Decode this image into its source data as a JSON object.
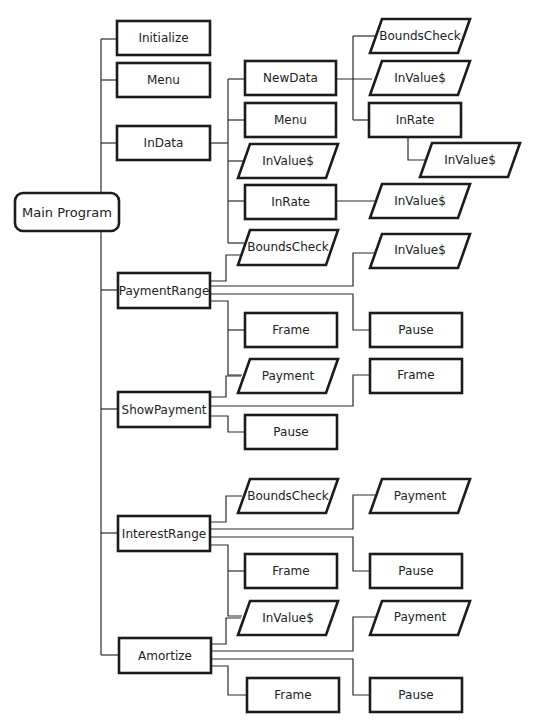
{
  "diagram": {
    "type": "structure-chart",
    "root": {
      "id": "main",
      "label": "Main Program",
      "shape": "rounded"
    },
    "nodes": [
      {
        "id": "initialize",
        "label": "Initialize",
        "shape": "rect",
        "parent": "main"
      },
      {
        "id": "menu",
        "label": "Menu",
        "shape": "rect",
        "parent": "main"
      },
      {
        "id": "indata",
        "label": "InData",
        "shape": "rect",
        "parent": "main"
      },
      {
        "id": "indata_newdata",
        "label": "NewData",
        "shape": "rect",
        "parent": "indata"
      },
      {
        "id": "indata_menu",
        "label": "Menu",
        "shape": "rect",
        "parent": "indata"
      },
      {
        "id": "indata_invalue",
        "label": "InValue$",
        "shape": "io",
        "parent": "indata"
      },
      {
        "id": "indata_inrate",
        "label": "InRate",
        "shape": "rect",
        "parent": "indata"
      },
      {
        "id": "indata_boundscheck",
        "label": "BoundsCheck",
        "shape": "io",
        "parent": "indata"
      },
      {
        "id": "newdata_boundscheck",
        "label": "BoundsCheck",
        "shape": "io",
        "parent": "indata_newdata"
      },
      {
        "id": "newdata_invalue",
        "label": "InValue$",
        "shape": "io",
        "parent": "indata_newdata"
      },
      {
        "id": "newdata_inrate",
        "label": "InRate",
        "shape": "rect",
        "parent": "indata_newdata"
      },
      {
        "id": "newdata_inrate_invalue",
        "label": "InValue$",
        "shape": "io",
        "parent": "newdata_inrate"
      },
      {
        "id": "inrate_invalue",
        "label": "InValue$",
        "shape": "io",
        "parent": "indata_inrate"
      },
      {
        "id": "paymentrange",
        "label": "PaymentRange",
        "shape": "rect",
        "parent": "main"
      },
      {
        "id": "pr_boundscheck",
        "label": "BoundsCheck",
        "shape": "io",
        "parent": "paymentrange"
      },
      {
        "id": "pr_invalue",
        "label": "InValue$",
        "shape": "io",
        "parent": "paymentrange"
      },
      {
        "id": "pr_frame",
        "label": "Frame",
        "shape": "rect",
        "parent": "paymentrange"
      },
      {
        "id": "pr_pause",
        "label": "Pause",
        "shape": "rect",
        "parent": "paymentrange"
      },
      {
        "id": "pr_payment",
        "label": "Payment",
        "shape": "io",
        "parent": "paymentrange"
      },
      {
        "id": "showpayment",
        "label": "ShowPayment",
        "shape": "rect",
        "parent": "main"
      },
      {
        "id": "sp_frame",
        "label": "Frame",
        "shape": "rect",
        "parent": "showpayment"
      },
      {
        "id": "sp_pause",
        "label": "Pause",
        "shape": "rect",
        "parent": "showpayment"
      },
      {
        "id": "interestrange",
        "label": "InterestRange",
        "shape": "rect",
        "parent": "main"
      },
      {
        "id": "ir_boundscheck",
        "label": "BoundsCheck",
        "shape": "io",
        "parent": "interestrange"
      },
      {
        "id": "ir_payment",
        "label": "Payment",
        "shape": "io",
        "parent": "interestrange"
      },
      {
        "id": "ir_frame",
        "label": "Frame",
        "shape": "rect",
        "parent": "interestrange"
      },
      {
        "id": "ir_pause",
        "label": "Pause",
        "shape": "rect",
        "parent": "interestrange"
      },
      {
        "id": "ir_invalue",
        "label": "InValue$",
        "shape": "io",
        "parent": "interestrange"
      },
      {
        "id": "amortize",
        "label": "Amortize",
        "shape": "rect",
        "parent": "main"
      },
      {
        "id": "am_payment",
        "label": "Payment",
        "shape": "io",
        "parent": "amortize"
      },
      {
        "id": "am_frame",
        "label": "Frame",
        "shape": "rect",
        "parent": "amortize"
      },
      {
        "id": "am_pause",
        "label": "Pause",
        "shape": "rect",
        "parent": "amortize"
      }
    ],
    "labels": {
      "main": "Main Program",
      "initialize": "Initialize",
      "menu": "Menu",
      "indata": "InData",
      "indata_newdata": "NewData",
      "indata_menu": "Menu",
      "indata_invalue": "InValue$",
      "indata_inrate": "InRate",
      "indata_boundscheck": "BoundsCheck",
      "newdata_boundscheck": "BoundsCheck",
      "newdata_invalue": "InValue$",
      "newdata_inrate": "InRate",
      "newdata_inrate_invalue": "InValue$",
      "inrate_invalue": "InValue$",
      "paymentrange": "PaymentRange",
      "pr_invalue": "InValue$",
      "pr_frame": "Frame",
      "pr_pause": "Pause",
      "pr_payment": "Payment",
      "showpayment": "ShowPayment",
      "sp_frame": "Frame",
      "sp_pause": "Pause",
      "interestrange": "InterestRange",
      "ir_boundscheck": "BoundsCheck",
      "ir_payment": "Payment",
      "ir_frame": "Frame",
      "ir_pause": "Pause",
      "ir_invalue": "InValue$",
      "amortize": "Amortize",
      "am_payment": "Payment",
      "am_frame": "Frame",
      "am_pause": "Pause"
    }
  }
}
